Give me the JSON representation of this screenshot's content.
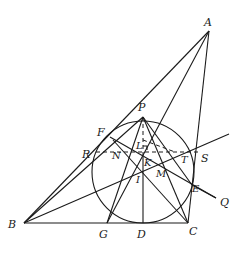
{
  "diagram": {
    "type": "geometry-figure",
    "points": {
      "A": {
        "label": "A",
        "x": 209,
        "y": 31
      },
      "B": {
        "label": "B",
        "x": 24,
        "y": 223
      },
      "C": {
        "label": "C",
        "x": 188,
        "y": 223
      },
      "D": {
        "label": "D",
        "x": 143,
        "y": 223
      },
      "E": {
        "label": "E",
        "x": 192,
        "y": 185
      },
      "F": {
        "label": "F",
        "x": 110,
        "y": 137
      },
      "G": {
        "label": "G",
        "x": 107,
        "y": 223
      },
      "I": {
        "label": "I",
        "x": 143,
        "y": 172
      },
      "K": {
        "label": "K",
        "x": 143,
        "y": 157
      },
      "L": {
        "label": "L",
        "x": 143,
        "y": 140
      },
      "M": {
        "label": "M",
        "x": 158,
        "y": 170
      },
      "N": {
        "label": "N",
        "x": 113,
        "y": 152
      },
      "P": {
        "label": "P",
        "x": 143,
        "y": 117
      },
      "Q": {
        "label": "Q",
        "x": 216,
        "y": 198
      },
      "R": {
        "label": "R",
        "x": 96,
        "y": 152
      },
      "S": {
        "label": "S",
        "x": 201,
        "y": 152
      },
      "T": {
        "label": "T",
        "x": 185,
        "y": 154
      }
    },
    "circle": {
      "center": "I",
      "radius": 51
    }
  }
}
